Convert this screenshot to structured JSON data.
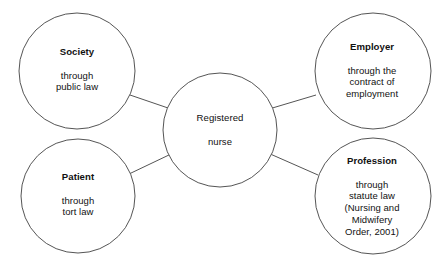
{
  "diagram": {
    "type": "node-link-circle-diagram",
    "background_color": "#ffffff",
    "stroke_color": "#555555",
    "text_color": "#111111",
    "center": {
      "id": "registered-nurse",
      "title": "Registered",
      "detail": "nurse",
      "title_bold": false,
      "cx": 220,
      "cy": 130,
      "r": 57,
      "text_x": 220,
      "text_y": 130
    },
    "nodes": [
      {
        "id": "society",
        "title": "Society",
        "detail": "through\npublic law",
        "title_bold": true,
        "cx": 77,
        "cy": 71,
        "r": 58,
        "text_x": 77,
        "text_y": 69
      },
      {
        "id": "employer",
        "title": "Employer",
        "detail": "through the\ncontract of\nemployment",
        "title_bold": true,
        "cx": 373,
        "cy": 71,
        "r": 58,
        "text_x": 372,
        "text_y": 70
      },
      {
        "id": "patient",
        "title": "Patient",
        "detail": "through\ntort law",
        "title_bold": true,
        "cx": 78,
        "cy": 196,
        "r": 57,
        "text_x": 78,
        "text_y": 194
      },
      {
        "id": "profession",
        "title": "Profession",
        "detail": "through\nstatute law\n(Nursing and\nMidwifery\nOrder, 2001)",
        "title_bold": true,
        "cx": 373,
        "cy": 196,
        "r": 58,
        "text_x": 372,
        "text_y": 196
      }
    ],
    "connectors": [
      {
        "id": "society-to-center",
        "from": "society",
        "to": "registered-nurse",
        "x1": 130,
        "y1": 95,
        "x2": 171,
        "y2": 109
      },
      {
        "id": "employer-to-center",
        "from": "registered-nurse",
        "to": "employer",
        "x1": 269,
        "y1": 109,
        "x2": 316,
        "y2": 95
      },
      {
        "id": "patient-to-center",
        "from": "patient",
        "to": "registered-nurse",
        "x1": 129,
        "y1": 174,
        "x2": 171,
        "y2": 154
      },
      {
        "id": "profession-to-center",
        "from": "registered-nurse",
        "to": "profession",
        "x1": 268,
        "y1": 153,
        "x2": 318,
        "y2": 175
      }
    ]
  }
}
